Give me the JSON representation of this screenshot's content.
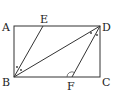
{
  "diagram": {
    "points": {
      "A": {
        "label": "A",
        "x": 14,
        "y": 26
      },
      "D": {
        "label": "D",
        "x": 100,
        "y": 26
      },
      "B": {
        "label": "B",
        "x": 14,
        "y": 77
      },
      "C": {
        "label": "C",
        "x": 100,
        "y": 77
      },
      "E": {
        "label": "E",
        "x": 43,
        "y": 26
      },
      "F": {
        "label": "F",
        "x": 72,
        "y": 77
      }
    },
    "segments": [
      "AD",
      "DC",
      "CB",
      "BA",
      "BE",
      "BD",
      "DF"
    ],
    "angle_marks": [
      {
        "at": "B",
        "between": [
          "BE",
          "BD"
        ],
        "style": "dots"
      },
      {
        "at": "D",
        "between": [
          "DB",
          "DF"
        ],
        "style": "dots"
      },
      {
        "at": "F",
        "between": [
          "FD",
          "FC"
        ],
        "style": "arc"
      }
    ]
  }
}
